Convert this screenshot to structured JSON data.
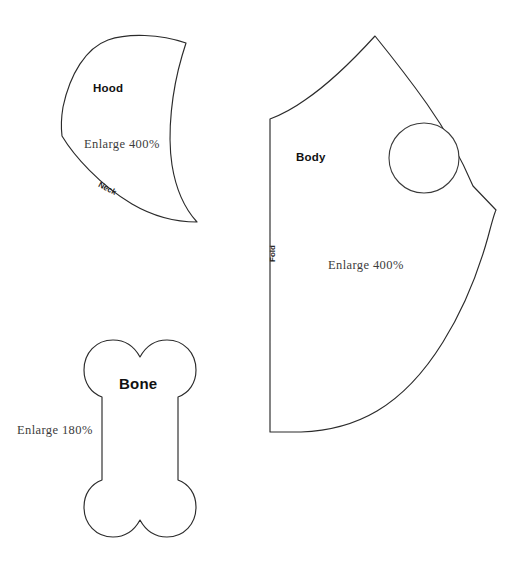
{
  "sheet": {
    "background_color": "#ffffff",
    "line_color": "#2b2b2b"
  },
  "pieces": [
    {
      "id": "hood",
      "name": "Hood",
      "enlarge_note": "Enlarge 400%",
      "edge_label": "Neck"
    },
    {
      "id": "body",
      "name": "Body",
      "enlarge_note": "Enlarge 400%",
      "edge_label": "Fold",
      "hole": "leg-hole"
    },
    {
      "id": "bone",
      "name": "Bone",
      "enlarge_note": "Enlarge 180%",
      "edge_label": ""
    }
  ]
}
